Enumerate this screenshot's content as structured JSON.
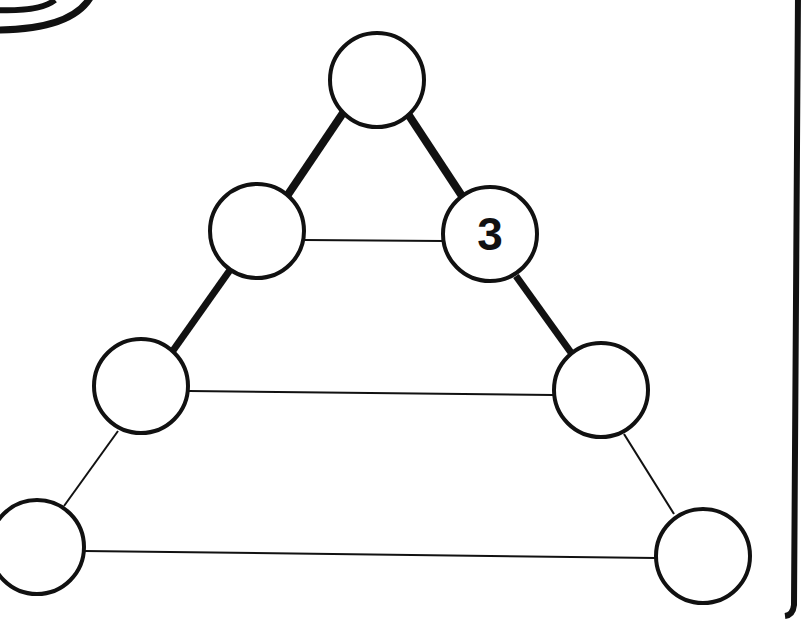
{
  "puzzle": {
    "type": "number-triangle",
    "colors": {
      "stroke": "#111111",
      "background": "#ffffff"
    },
    "nodes": [
      {
        "id": "top",
        "x": 377,
        "y": 80,
        "value": ""
      },
      {
        "id": "row2-left",
        "x": 257,
        "y": 231,
        "value": ""
      },
      {
        "id": "row2-right",
        "x": 490,
        "y": 234,
        "value": "3"
      },
      {
        "id": "row3-left",
        "x": 141,
        "y": 386,
        "value": ""
      },
      {
        "id": "row3-right",
        "x": 601,
        "y": 390,
        "value": ""
      },
      {
        "id": "row4-left",
        "x": 37,
        "y": 547,
        "value": ""
      },
      {
        "id": "row4-right",
        "x": 703,
        "y": 556,
        "value": ""
      }
    ]
  }
}
